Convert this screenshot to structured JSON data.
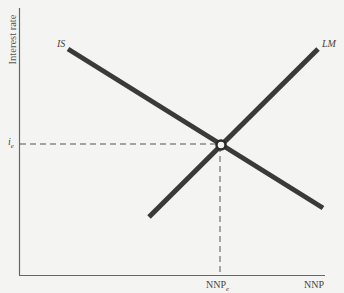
{
  "diagram": {
    "type": "IS-LM model",
    "y_axis_label": "Interest rate",
    "x_axis_label": "NNP",
    "curves": [
      {
        "name": "IS",
        "slope": "downward",
        "label": "IS"
      },
      {
        "name": "LM",
        "slope": "upward",
        "label": "LM"
      }
    ],
    "equilibrium": {
      "interest_label_main": "i",
      "interest_label_sub": "e",
      "nnp_label_main": "NNP",
      "nnp_label_sub": "e"
    }
  }
}
